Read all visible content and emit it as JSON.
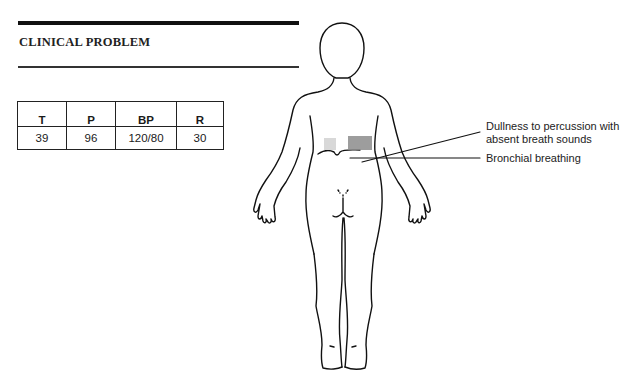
{
  "section": {
    "title": "CLINICAL PROBLEM"
  },
  "vitals": {
    "headers": [
      "T",
      "P",
      "BP",
      "R"
    ],
    "values": [
      "39",
      "96",
      "120/80",
      "30"
    ]
  },
  "figure": {
    "view": "posterior body outline",
    "annotations": [
      {
        "id": "dullness",
        "line1": "Dullness to percussion with",
        "line2": "absent breath sounds"
      },
      {
        "id": "bronchial",
        "line1": "Bronchial breathing"
      }
    ],
    "colors": {
      "dullness_shade": "#8c8c8c",
      "light_shade": "#d8d8d8",
      "outline": "#111111"
    }
  }
}
